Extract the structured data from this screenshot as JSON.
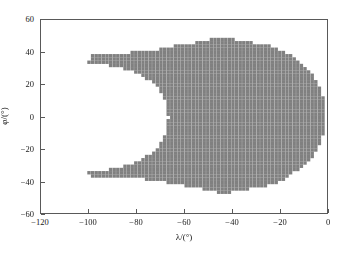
{
  "chart_data": {
    "type": "scatter",
    "title": "",
    "xlabel": "λ/(°)",
    "ylabel": "φ/(°)",
    "xlim": [
      -120,
      0
    ],
    "ylim": [
      -60,
      60
    ],
    "xticks": [
      -120,
      -100,
      -80,
      -60,
      -40,
      -20,
      0
    ],
    "xticklabels": [
      "−120",
      "−100",
      "−80",
      "−60",
      "−40",
      "−20",
      "0"
    ],
    "yticks": [
      -60,
      -40,
      -20,
      0,
      20,
      40,
      60
    ],
    "yticklabels": [
      "−60",
      "−40",
      "−20",
      "0",
      "20",
      "40",
      "60"
    ],
    "grid": false,
    "legend": null,
    "marker": {
      "shape": "square",
      "color": "#808080",
      "size_px": 3.4,
      "edge_color": "#808080"
    },
    "series": [
      {
        "name": "coverage",
        "description": "Dense regular grid of grey square markers filling a kidney / C-shaped region, concave on its left side; upper and lower narrow arms extend leftward to about -100 degrees at +-35 degrees latitude.",
        "grid_step_lambda": 1.5,
        "grid_step_phi": 2.0,
        "lambda_range": [
          -100.0,
          -2.0
        ],
        "phi_range": [
          -47.0,
          50.0
        ],
        "boundary_top": [
          [
            -99.5,
            35.0
          ],
          [
            -98.0,
            39.5
          ],
          [
            -94.0,
            39.5
          ],
          [
            -90.0,
            39.0
          ],
          [
            -86.0,
            39.0
          ],
          [
            -82.0,
            40.0
          ],
          [
            -78.0,
            40.0
          ],
          [
            -74.0,
            41.0
          ],
          [
            -70.0,
            42.0
          ],
          [
            -66.0,
            43.5
          ],
          [
            -62.0,
            44.5
          ],
          [
            -58.0,
            45.5
          ],
          [
            -54.0,
            46.5
          ],
          [
            -50.0,
            48.0
          ],
          [
            -46.0,
            49.5
          ],
          [
            -43.0,
            49.5
          ],
          [
            -40.0,
            48.5
          ],
          [
            -36.0,
            47.0
          ],
          [
            -32.0,
            46.0
          ],
          [
            -28.0,
            45.5
          ],
          [
            -24.0,
            44.0
          ],
          [
            -20.0,
            41.5
          ],
          [
            -16.0,
            38.0
          ],
          [
            -12.0,
            33.5
          ],
          [
            -8.0,
            28.0
          ],
          [
            -5.0,
            22.0
          ],
          [
            -3.0,
            16.0
          ],
          [
            -2.0,
            8.0
          ]
        ],
        "boundary_bottom": [
          [
            -99.5,
            -34.0
          ],
          [
            -98.0,
            -37.0
          ],
          [
            -94.0,
            -37.0
          ],
          [
            -90.0,
            -36.5
          ],
          [
            -86.0,
            -36.5
          ],
          [
            -82.0,
            -37.0
          ],
          [
            -78.0,
            -37.5
          ],
          [
            -74.0,
            -38.5
          ],
          [
            -70.0,
            -39.5
          ],
          [
            -66.0,
            -40.5
          ],
          [
            -62.0,
            -41.5
          ],
          [
            -58.0,
            -42.5
          ],
          [
            -54.0,
            -43.5
          ],
          [
            -50.0,
            -45.0
          ],
          [
            -46.0,
            -46.5
          ],
          [
            -43.0,
            -46.5
          ],
          [
            -40.0,
            -45.5
          ],
          [
            -36.0,
            -44.5
          ],
          [
            -32.0,
            -43.5
          ],
          [
            -28.0,
            -43.0
          ],
          [
            -24.0,
            -41.5
          ],
          [
            -20.0,
            -39.0
          ],
          [
            -16.0,
            -35.5
          ],
          [
            -12.0,
            -31.0
          ],
          [
            -8.0,
            -26.0
          ],
          [
            -5.0,
            -20.0
          ],
          [
            -3.0,
            -14.0
          ],
          [
            -2.0,
            -7.0
          ]
        ],
        "inner_notch": [
          [
            -99.0,
            33.0
          ],
          [
            -95.0,
            32.5
          ],
          [
            -90.0,
            31.5
          ],
          [
            -86.0,
            30.0
          ],
          [
            -82.0,
            28.0
          ],
          [
            -78.0,
            25.5
          ],
          [
            -75.0,
            23.0
          ],
          [
            -72.0,
            19.5
          ],
          [
            -70.0,
            15.0
          ],
          [
            -68.5,
            10.0
          ],
          [
            -67.5,
            4.0
          ],
          [
            -67.0,
            0.0
          ],
          [
            -67.5,
            -4.0
          ],
          [
            -68.5,
            -10.0
          ],
          [
            -70.0,
            -15.0
          ],
          [
            -72.0,
            -19.5
          ],
          [
            -75.0,
            -23.0
          ],
          [
            -78.0,
            -25.5
          ],
          [
            -82.0,
            -28.0
          ],
          [
            -86.0,
            -30.0
          ],
          [
            -90.0,
            -31.5
          ],
          [
            -95.0,
            -32.5
          ],
          [
            -99.0,
            -33.0
          ]
        ]
      }
    ]
  },
  "axes": {
    "x_title": "λ/(°)",
    "y_title": "φ/(°)",
    "x_ticks": [
      {
        "value": -120,
        "label": "−120"
      },
      {
        "value": -100,
        "label": "−100"
      },
      {
        "value": -80,
        "label": "−80"
      },
      {
        "value": -60,
        "label": "−60"
      },
      {
        "value": -40,
        "label": "−40"
      },
      {
        "value": -20,
        "label": "−20"
      },
      {
        "value": 0,
        "label": "0"
      }
    ],
    "y_ticks": [
      {
        "value": 60,
        "label": "60"
      },
      {
        "value": 40,
        "label": "40"
      },
      {
        "value": 20,
        "label": "20"
      },
      {
        "value": 0,
        "label": "0"
      },
      {
        "value": -20,
        "label": "−20"
      },
      {
        "value": -40,
        "label": "−40"
      },
      {
        "value": -60,
        "label": "−60"
      }
    ]
  },
  "style": {
    "marker_color": "#808080",
    "frame_color": "#595959",
    "background": "#ffffff",
    "text_color": "#1a1a1a"
  }
}
